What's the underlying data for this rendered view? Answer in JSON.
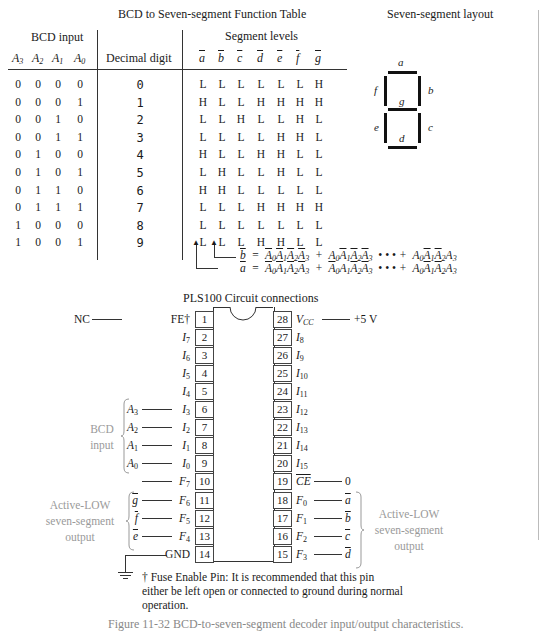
{
  "function_table": {
    "title": "BCD to Seven-segment Function Table",
    "group_headers": {
      "bcd_input": "BCD input",
      "segment_levels": "Segment levels"
    },
    "columns": {
      "inputs": [
        "A3",
        "A2",
        "A1",
        "A0"
      ],
      "decimal": "Decimal digit",
      "segments": [
        "a",
        "b",
        "c",
        "d",
        "e",
        "f",
        "g"
      ]
    },
    "rows": [
      {
        "inputs": [
          "0",
          "0",
          "0",
          "0"
        ],
        "digit": "0",
        "segments": [
          "L",
          "L",
          "L",
          "L",
          "L",
          "L",
          "H"
        ]
      },
      {
        "inputs": [
          "0",
          "0",
          "0",
          "1"
        ],
        "digit": "1",
        "segments": [
          "H",
          "L",
          "L",
          "H",
          "H",
          "H",
          "H"
        ]
      },
      {
        "inputs": [
          "0",
          "0",
          "1",
          "0"
        ],
        "digit": "2",
        "segments": [
          "L",
          "L",
          "H",
          "L",
          "L",
          "H",
          "L"
        ]
      },
      {
        "inputs": [
          "0",
          "0",
          "1",
          "1"
        ],
        "digit": "3",
        "segments": [
          "L",
          "L",
          "L",
          "L",
          "H",
          "H",
          "L"
        ]
      },
      {
        "inputs": [
          "0",
          "1",
          "0",
          "0"
        ],
        "digit": "4",
        "segments": [
          "H",
          "L",
          "L",
          "H",
          "H",
          "L",
          "L"
        ]
      },
      {
        "inputs": [
          "0",
          "1",
          "0",
          "1"
        ],
        "digit": "5",
        "segments": [
          "L",
          "H",
          "L",
          "L",
          "H",
          "L",
          "L"
        ]
      },
      {
        "inputs": [
          "0",
          "1",
          "1",
          "0"
        ],
        "digit": "6",
        "segments": [
          "H",
          "H",
          "L",
          "L",
          "L",
          "L",
          "L"
        ]
      },
      {
        "inputs": [
          "0",
          "1",
          "1",
          "1"
        ],
        "digit": "7",
        "segments": [
          "L",
          "L",
          "L",
          "H",
          "H",
          "H",
          "H"
        ]
      },
      {
        "inputs": [
          "1",
          "0",
          "0",
          "0"
        ],
        "digit": "8",
        "segments": [
          "L",
          "L",
          "L",
          "L",
          "L",
          "L",
          "L"
        ]
      },
      {
        "inputs": [
          "1",
          "0",
          "0",
          "1"
        ],
        "digit": "9",
        "segments": [
          "L",
          "L",
          "L",
          "H",
          "H",
          "L",
          "L"
        ]
      }
    ],
    "equations": {
      "b": {
        "lhs": "b",
        "terms": [
          "A0A1A2A3 (all inverted)",
          "A0 A1' A2' A3'",
          "•••",
          "A0 A1' A2' A3"
        ]
      },
      "a": {
        "lhs": "a",
        "terms": [
          "A0' A1' A2' A3'",
          "A0' A1 A2' A3'",
          "•••",
          "A0 A1' A2' A3"
        ]
      },
      "ellipsis": "• • •"
    }
  },
  "segment_layout": {
    "title": "Seven-segment layout",
    "labels": {
      "a": "a",
      "b": "b",
      "c": "c",
      "d": "d",
      "e": "e",
      "f": "f",
      "g": "g"
    }
  },
  "circuit": {
    "title": "PLS100 Circuit connections",
    "left_pins": [
      {
        "num": "1",
        "name": "FE†",
        "ext": "NC"
      },
      {
        "num": "2",
        "name": "I7",
        "ext": ""
      },
      {
        "num": "3",
        "name": "I6",
        "ext": ""
      },
      {
        "num": "4",
        "name": "I5",
        "ext": ""
      },
      {
        "num": "5",
        "name": "I4",
        "ext": ""
      },
      {
        "num": "6",
        "name": "I3",
        "ext": "A3"
      },
      {
        "num": "7",
        "name": "I2",
        "ext": "A2"
      },
      {
        "num": "8",
        "name": "I1",
        "ext": "A1"
      },
      {
        "num": "9",
        "name": "I0",
        "ext": "A0"
      },
      {
        "num": "10",
        "name": "F7",
        "ext": ""
      },
      {
        "num": "11",
        "name": "F6",
        "ext": "g"
      },
      {
        "num": "12",
        "name": "F5",
        "ext": "f"
      },
      {
        "num": "13",
        "name": "F4",
        "ext": "e"
      },
      {
        "num": "14",
        "name": "GND",
        "ext": ""
      }
    ],
    "right_pins": [
      {
        "num": "28",
        "name": "VCC",
        "ext": "+5 V"
      },
      {
        "num": "27",
        "name": "I8",
        "ext": ""
      },
      {
        "num": "26",
        "name": "I9",
        "ext": ""
      },
      {
        "num": "25",
        "name": "I10",
        "ext": ""
      },
      {
        "num": "24",
        "name": "I11",
        "ext": ""
      },
      {
        "num": "23",
        "name": "I12",
        "ext": ""
      },
      {
        "num": "22",
        "name": "I13",
        "ext": ""
      },
      {
        "num": "21",
        "name": "I14",
        "ext": ""
      },
      {
        "num": "20",
        "name": "I15",
        "ext": ""
      },
      {
        "num": "19",
        "name": "CE",
        "ext": "0"
      },
      {
        "num": "18",
        "name": "F0",
        "ext": "a"
      },
      {
        "num": "17",
        "name": "F1",
        "ext": "b"
      },
      {
        "num": "16",
        "name": "F2",
        "ext": "c"
      },
      {
        "num": "15",
        "name": "F3",
        "ext": "d"
      }
    ],
    "group_labels": {
      "bcd_input": [
        "BCD",
        "input"
      ],
      "active_low_left": [
        "Active-LOW",
        "seven-segment",
        "output"
      ],
      "active_low_right": [
        "Active-LOW",
        "seven-segment",
        "output"
      ]
    },
    "footnote": [
      "† Fuse Enable Pin: It is recommended that this pin",
      "either be left open or connected to ground during normal",
      "operation."
    ]
  },
  "caption_partial": "Figure 11-32   BCD-to-seven-segment decoder input/output characteristics."
}
